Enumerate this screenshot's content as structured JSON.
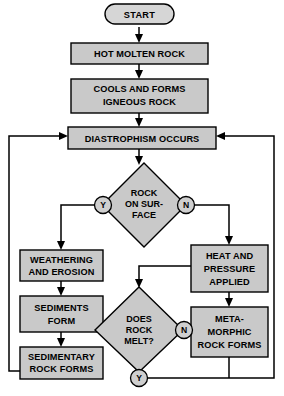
{
  "diagram": {
    "colors": {
      "node_fill": "#c9c9c9",
      "node_stroke": "#000000",
      "background": "#ffffff",
      "connector": "#000000"
    },
    "nodes": {
      "start": {
        "label": "START",
        "shape": "stadium"
      },
      "hot_molten_rock": {
        "label": "HOT MOLTEN ROCK",
        "shape": "rect"
      },
      "cools_forms": {
        "line1": "COOLS AND FORMS",
        "line2": "IGNEOUS ROCK",
        "shape": "rect"
      },
      "diastrophism": {
        "label": "DIASTROPHISM OCCURS",
        "shape": "rect"
      },
      "rock_on_surface": {
        "line1": "ROCK",
        "line2": "ON SUR-",
        "line3": "FACE",
        "shape": "diamond"
      },
      "weathering": {
        "line1": "WEATHERING",
        "line2": "AND EROSION",
        "shape": "rect"
      },
      "sediments": {
        "line1": "SEDIMENTS",
        "line2": "FORM",
        "shape": "rect"
      },
      "sedimentary": {
        "line1": "SEDIMENTARY",
        "line2": "ROCK FORMS",
        "shape": "rect"
      },
      "heat_pressure": {
        "line1": "HEAT AND",
        "line2": "PRESSURE",
        "line3": "APPLIED",
        "shape": "rect"
      },
      "metamorphic": {
        "line1": "META-",
        "line2": "MORPHIC",
        "line3": "ROCK FORMS",
        "shape": "rect"
      },
      "does_rock_melt": {
        "line1": "DOES",
        "line2": "ROCK",
        "line3": "MELT?",
        "shape": "diamond"
      }
    },
    "branch_labels": {
      "surface_yes": "Y",
      "surface_no": "N",
      "melt_no": "N",
      "melt_yes": "Y"
    }
  }
}
